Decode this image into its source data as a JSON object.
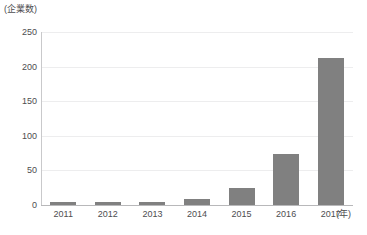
{
  "chart_data": {
    "type": "bar",
    "title": "",
    "subtitle": "",
    "xlabel": "(年)",
    "ylabel": "(企業数)",
    "categories": [
      "2011",
      "2012",
      "2013",
      "2014",
      "2015",
      "2016",
      "2017"
    ],
    "values": [
      4,
      5,
      5,
      8,
      24,
      73,
      212
    ],
    "series": [
      {
        "name": "企業数",
        "values": [
          4,
          5,
          5,
          8,
          24,
          73,
          212
        ]
      }
    ],
    "ylim": [
      0,
      250
    ],
    "y_ticks": [
      "0",
      "50",
      "100",
      "150",
      "200",
      "250"
    ],
    "y_tick_values": [
      0,
      50,
      100,
      150,
      200,
      250
    ],
    "grid": true,
    "legend": "none",
    "bar_color": "#808080",
    "gridline_color": "#ededee",
    "axis_color": "#b8b8ba",
    "text_color": "#4d4d4f",
    "background_color": "#ffffff"
  },
  "axes": {
    "y_unit_label": "(企業数)",
    "x_unit_label": "(年)"
  },
  "caption": {
    "bottom_clipped_text": ""
  }
}
